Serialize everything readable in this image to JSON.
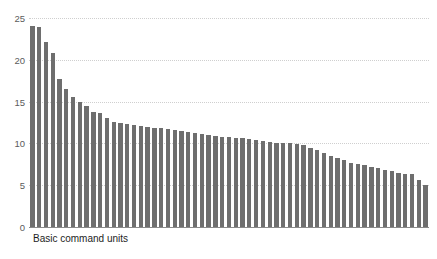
{
  "chart_data": {
    "type": "bar",
    "title": "",
    "xlabel": "Basic command units",
    "ylabel": "",
    "ylim": [
      0,
      25
    ],
    "yticks": [
      0,
      5,
      10,
      15,
      20,
      25
    ],
    "ytick_labels": [
      "0",
      "5",
      "10",
      "15",
      "20",
      "25"
    ],
    "grid": true,
    "grid_style": "dotted-horizontal",
    "legend": false,
    "legend_position": "none",
    "bar_color": "#6e6e6e",
    "sorted": "descending",
    "categories": [
      "1",
      "2",
      "3",
      "4",
      "5",
      "6",
      "7",
      "8",
      "9",
      "10",
      "11",
      "12",
      "13",
      "14",
      "15",
      "16",
      "17",
      "18",
      "19",
      "20",
      "21",
      "22",
      "23",
      "24",
      "25",
      "26",
      "27",
      "28",
      "29",
      "30",
      "31",
      "32",
      "33",
      "34",
      "35",
      "36",
      "37",
      "38",
      "39",
      "40",
      "41",
      "42",
      "43",
      "44",
      "45",
      "46",
      "47",
      "48",
      "49",
      "50",
      "51",
      "52",
      "53",
      "54",
      "55",
      "56",
      "57",
      "58",
      "59"
    ],
    "values": [
      24.0,
      23.9,
      22.1,
      20.8,
      17.7,
      16.5,
      15.5,
      14.9,
      14.5,
      13.8,
      13.6,
      13.0,
      12.6,
      12.5,
      12.3,
      12.2,
      12.1,
      12.0,
      11.9,
      11.8,
      11.7,
      11.6,
      11.5,
      11.4,
      11.2,
      11.1,
      11.0,
      10.9,
      10.8,
      10.8,
      10.7,
      10.6,
      10.5,
      10.4,
      10.3,
      10.2,
      10.1,
      10.1,
      10.0,
      9.9,
      9.8,
      9.5,
      9.2,
      8.8,
      8.5,
      8.3,
      8.0,
      7.6,
      7.5,
      7.4,
      7.2,
      7.0,
      6.8,
      6.7,
      6.5,
      6.4,
      6.3,
      5.6,
      5.0
    ]
  },
  "axis": {
    "y_ticks": [
      "25",
      "20",
      "15",
      "10",
      "5",
      "0"
    ],
    "x_label": "Basic command units"
  },
  "title": {
    "text": ""
  }
}
